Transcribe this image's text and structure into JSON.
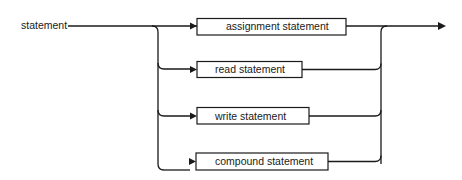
{
  "diagram": {
    "type": "syntax-diagram",
    "entry_label": "statement",
    "alternatives": [
      {
        "label": "assignment statement"
      },
      {
        "label": "read statement"
      },
      {
        "label": "write statement"
      },
      {
        "label": "compound statement"
      }
    ],
    "colors": {
      "stroke": "#1a1a1a",
      "background": "#ffffff"
    }
  }
}
